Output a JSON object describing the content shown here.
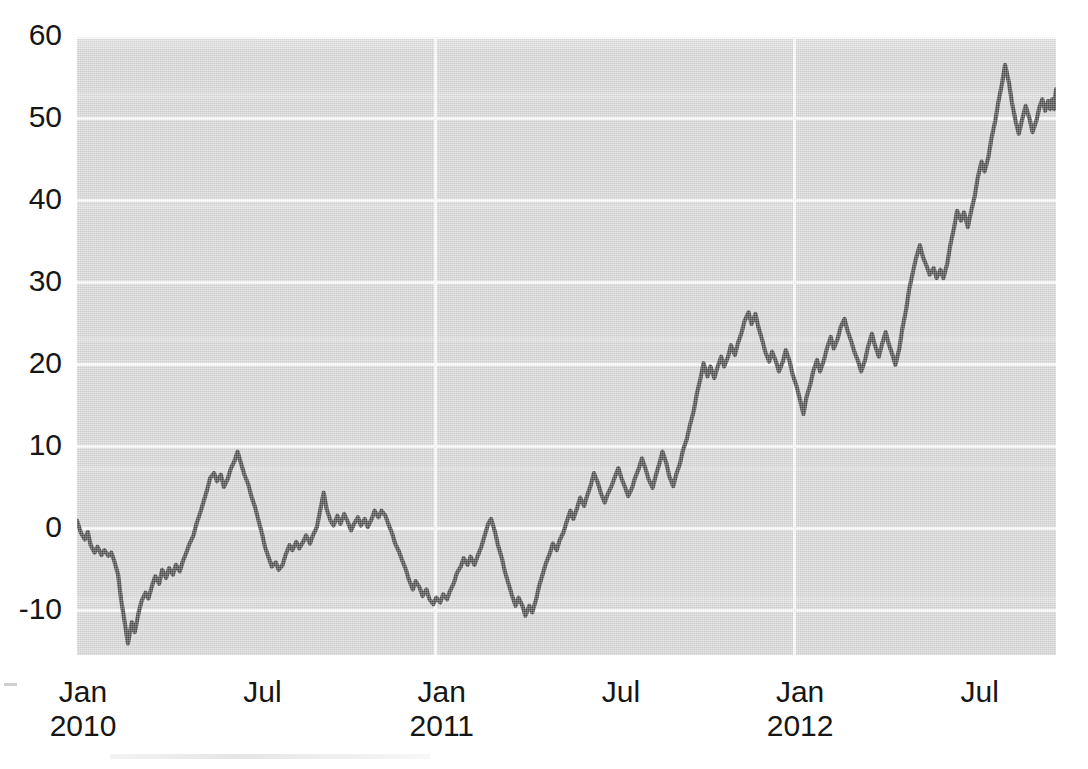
{
  "chart_data": {
    "type": "line",
    "title": "",
    "subtitle": "",
    "xlabel": "",
    "ylabel": "",
    "grid": true,
    "legend": "none",
    "background_color": "#d9d9d9",
    "line_color": "#4d4d4d",
    "gridline_color": "#ffffff",
    "xlim": [
      "2010-01-01",
      "2012-09-20"
    ],
    "ylim": [
      -15.4,
      60
    ],
    "y_ticks": [
      60,
      50,
      40,
      30,
      20,
      10,
      0,
      -10
    ],
    "y_tick_labels": [
      "60",
      "50",
      "40",
      "30",
      "20",
      "10",
      "0",
      "-10"
    ],
    "x_ticks": [
      "2010-01",
      "2010-07",
      "2011-01",
      "2011-07",
      "2012-01",
      "2012-07"
    ],
    "x_tick_labels": [
      {
        "month": "Jan",
        "year": "2010"
      },
      {
        "month": "Jul",
        "year": ""
      },
      {
        "month": "Jan",
        "year": "2011"
      },
      {
        "month": "Jul",
        "year": ""
      },
      {
        "month": "Jan",
        "year": "2012"
      },
      {
        "month": "Jul",
        "year": ""
      }
    ],
    "series": [
      {
        "name": "series-1",
        "color": "#4d4d4d",
        "x": [
          0.0,
          0.006,
          0.012,
          0.018,
          0.024,
          0.03,
          0.036,
          0.042,
          0.048,
          0.054,
          0.06,
          0.066,
          0.072,
          0.078,
          0.084,
          0.09,
          0.096,
          0.102,
          0.108,
          0.114,
          0.12,
          0.126,
          0.132,
          0.138,
          0.144,
          0.15,
          0.156,
          0.162,
          0.168,
          0.174,
          0.18,
          0.186,
          0.192,
          0.198,
          0.204,
          0.21,
          0.216,
          0.222,
          0.228,
          0.234,
          0.24,
          0.246,
          0.252,
          0.258,
          0.264,
          0.27,
          0.276,
          0.282,
          0.288,
          0.294,
          0.3,
          0.306,
          0.312,
          0.318,
          0.324,
          0.33,
          0.336,
          0.342,
          0.348,
          0.354,
          0.36,
          0.366,
          0.372,
          0.378,
          0.384,
          0.39,
          0.396,
          0.402,
          0.408,
          0.414,
          0.42,
          0.426,
          0.432,
          0.438,
          0.444,
          0.45,
          0.456,
          0.462,
          0.468,
          0.474,
          0.48,
          0.486,
          0.492,
          0.498,
          0.504,
          0.51,
          0.516,
          0.522,
          0.528,
          0.534,
          0.54,
          0.546,
          0.552,
          0.558,
          0.564,
          0.57,
          0.576,
          0.582,
          0.588,
          0.594,
          0.6,
          0.606,
          0.612,
          0.618,
          0.624,
          0.63,
          0.636,
          0.642,
          0.648,
          0.654,
          0.66,
          0.666,
          0.672,
          0.678,
          0.684,
          0.69,
          0.696,
          0.702,
          0.708,
          0.714,
          0.72,
          0.726,
          0.732,
          0.738,
          0.744,
          0.75,
          0.756,
          0.762,
          0.768,
          0.774,
          0.78,
          0.786,
          0.792,
          0.798,
          0.804,
          0.81,
          0.816,
          0.822,
          0.828,
          0.834,
          0.84,
          0.846,
          0.852,
          0.858,
          0.864,
          0.87,
          0.876,
          0.882,
          0.888,
          0.894,
          0.9,
          0.906,
          0.912,
          0.918,
          0.924,
          0.93,
          0.936,
          0.942,
          0.948,
          0.954,
          0.96,
          0.966,
          0.972,
          0.978,
          0.984,
          0.99,
          0.996,
          1.0
        ],
        "y": [
          1.0,
          -0.6,
          -1.5,
          -0.8,
          -2.2,
          -3.0,
          -2.4,
          -3.2,
          -2.8,
          -3.4,
          -3.0,
          -4.0,
          -6.0,
          -9.0,
          -12.0,
          -14.0,
          -11.5,
          -12.5,
          -10.5,
          -9.0,
          -8.0,
          -8.6,
          -7.0,
          -6.0,
          -6.8,
          -5.2,
          -6.2,
          -5.0,
          -5.8,
          -4.6,
          -5.4,
          -4.2,
          -3.0,
          -2.0,
          -1.0,
          0.4,
          1.8,
          3.0,
          4.6,
          6.0,
          6.6,
          5.6,
          6.4,
          5.0,
          6.0,
          7.2,
          8.2,
          9.4,
          7.8,
          6.6,
          5.4,
          4.0,
          2.6,
          1.2,
          -0.6,
          -2.2,
          -3.6,
          -4.6,
          -4.2,
          -5.0,
          -4.4,
          -3.2,
          -2.0,
          -2.6,
          -1.6,
          -2.4,
          -1.6,
          -0.8,
          -1.8,
          -0.8,
          0.2,
          2.0,
          4.4,
          2.4,
          1.0,
          0.4,
          1.6,
          0.6,
          1.8,
          1.0,
          -0.2,
          0.6,
          1.4,
          0.4,
          1.2,
          0.2,
          1.2,
          2.2,
          1.4,
          2.2,
          1.6,
          0.6,
          -0.6,
          -1.8,
          -2.8,
          -3.8,
          -5.0,
          -6.2,
          -7.4,
          -6.4,
          -7.2,
          -8.2,
          -7.4,
          -8.6,
          -9.2,
          -8.4,
          -9.0,
          -8.0,
          -8.6,
          -7.6,
          -6.6,
          -5.4,
          -4.6,
          -3.6,
          -4.4,
          -3.4,
          -4.4,
          -3.4,
          -2.2,
          -1.0,
          0.6,
          1.2,
          -0.4,
          -2.0,
          -3.6,
          -5.2,
          -6.8,
          -8.0,
          -9.4,
          -8.4,
          -9.4,
          -10.6,
          -9.4,
          -10.0,
          -8.6,
          -7.0,
          -5.4,
          -4.2,
          -3.0,
          -1.8,
          -2.6,
          -1.4,
          -0.4,
          0.8,
          2.2,
          1.2,
          2.6,
          3.8,
          2.8,
          4.0,
          5.4,
          6.8,
          5.6,
          4.4,
          3.2,
          4.2,
          5.2,
          6.2,
          7.4,
          6.2,
          5.0,
          4.0,
          5.0,
          6.2,
          7.4,
          8.6,
          9.2,
          10.0
        ],
        "notes": "cumulative series, Jan 2010 - Sep 2012"
      }
    ],
    "value_range": {
      "min": -14.0,
      "max": 57.0
    }
  },
  "series_points": [
    [
      0.0,
      1.0
    ],
    [
      0.004,
      -0.5
    ],
    [
      0.008,
      -1.3
    ],
    [
      0.011,
      -0.4
    ],
    [
      0.014,
      -2.0
    ],
    [
      0.018,
      -2.9
    ],
    [
      0.021,
      -2.2
    ],
    [
      0.025,
      -3.2
    ],
    [
      0.028,
      -2.6
    ],
    [
      0.032,
      -3.3
    ],
    [
      0.035,
      -2.9
    ],
    [
      0.038,
      -3.9
    ],
    [
      0.042,
      -5.6
    ],
    [
      0.045,
      -8.6
    ],
    [
      0.049,
      -11.6
    ],
    [
      0.052,
      -14.0
    ],
    [
      0.056,
      -11.4
    ],
    [
      0.059,
      -12.6
    ],
    [
      0.063,
      -10.2
    ],
    [
      0.066,
      -8.8
    ],
    [
      0.07,
      -7.8
    ],
    [
      0.073,
      -8.5
    ],
    [
      0.077,
      -6.8
    ],
    [
      0.08,
      -5.8
    ],
    [
      0.084,
      -6.7
    ],
    [
      0.087,
      -5.0
    ],
    [
      0.091,
      -6.0
    ],
    [
      0.094,
      -4.8
    ],
    [
      0.098,
      -5.6
    ],
    [
      0.101,
      -4.4
    ],
    [
      0.105,
      -5.2
    ],
    [
      0.108,
      -4.0
    ],
    [
      0.112,
      -2.8
    ],
    [
      0.115,
      -1.8
    ],
    [
      0.119,
      -0.8
    ],
    [
      0.122,
      0.6
    ],
    [
      0.126,
      2.0
    ],
    [
      0.129,
      3.2
    ],
    [
      0.133,
      4.8
    ],
    [
      0.136,
      6.2
    ],
    [
      0.14,
      6.8
    ],
    [
      0.143,
      5.8
    ],
    [
      0.147,
      6.6
    ],
    [
      0.15,
      5.1
    ],
    [
      0.154,
      6.1
    ],
    [
      0.157,
      7.3
    ],
    [
      0.161,
      8.3
    ],
    [
      0.164,
      9.4
    ],
    [
      0.168,
      7.8
    ],
    [
      0.171,
      6.6
    ],
    [
      0.175,
      5.4
    ],
    [
      0.178,
      4.0
    ],
    [
      0.182,
      2.6
    ],
    [
      0.185,
      1.2
    ],
    [
      0.189,
      -0.6
    ],
    [
      0.192,
      -2.2
    ],
    [
      0.196,
      -3.6
    ],
    [
      0.199,
      -4.6
    ],
    [
      0.203,
      -4.1
    ],
    [
      0.206,
      -5.0
    ],
    [
      0.21,
      -4.4
    ],
    [
      0.213,
      -3.2
    ],
    [
      0.217,
      -2.0
    ],
    [
      0.22,
      -2.6
    ],
    [
      0.224,
      -1.6
    ],
    [
      0.227,
      -2.4
    ],
    [
      0.231,
      -1.6
    ],
    [
      0.234,
      -0.8
    ],
    [
      0.238,
      -1.8
    ],
    [
      0.241,
      -0.8
    ],
    [
      0.245,
      0.2
    ],
    [
      0.248,
      2.0
    ],
    [
      0.252,
      4.4
    ],
    [
      0.255,
      2.4
    ],
    [
      0.259,
      1.0
    ],
    [
      0.262,
      0.4
    ],
    [
      0.266,
      1.6
    ],
    [
      0.269,
      0.6
    ],
    [
      0.273,
      1.8
    ],
    [
      0.276,
      1.0
    ],
    [
      0.28,
      -0.2
    ],
    [
      0.283,
      0.6
    ],
    [
      0.287,
      1.4
    ],
    [
      0.29,
      0.4
    ],
    [
      0.294,
      1.2
    ],
    [
      0.297,
      0.2
    ],
    [
      0.301,
      1.2
    ],
    [
      0.304,
      2.2
    ],
    [
      0.308,
      1.4
    ],
    [
      0.311,
      2.2
    ],
    [
      0.315,
      1.6
    ],
    [
      0.318,
      0.6
    ],
    [
      0.322,
      -0.6
    ],
    [
      0.325,
      -1.8
    ],
    [
      0.329,
      -2.8
    ],
    [
      0.332,
      -3.8
    ],
    [
      0.336,
      -5.0
    ],
    [
      0.339,
      -6.2
    ],
    [
      0.343,
      -7.4
    ],
    [
      0.346,
      -6.4
    ],
    [
      0.35,
      -7.2
    ],
    [
      0.353,
      -8.2
    ],
    [
      0.357,
      -7.4
    ],
    [
      0.36,
      -8.6
    ],
    [
      0.364,
      -9.2
    ],
    [
      0.367,
      -8.4
    ],
    [
      0.371,
      -9.0
    ],
    [
      0.374,
      -8.0
    ],
    [
      0.378,
      -8.6
    ],
    [
      0.381,
      -7.6
    ],
    [
      0.385,
      -6.6
    ],
    [
      0.388,
      -5.4
    ],
    [
      0.392,
      -4.6
    ],
    [
      0.395,
      -3.6
    ],
    [
      0.399,
      -4.4
    ],
    [
      0.402,
      -3.4
    ],
    [
      0.406,
      -4.4
    ],
    [
      0.409,
      -3.4
    ],
    [
      0.413,
      -2.2
    ],
    [
      0.416,
      -1.0
    ],
    [
      0.42,
      0.6
    ],
    [
      0.423,
      1.2
    ],
    [
      0.427,
      -0.4
    ],
    [
      0.43,
      -2.0
    ],
    [
      0.434,
      -3.6
    ],
    [
      0.437,
      -5.2
    ],
    [
      0.441,
      -6.8
    ],
    [
      0.444,
      -8.0
    ],
    [
      0.448,
      -9.4
    ],
    [
      0.451,
      -8.4
    ],
    [
      0.455,
      -9.4
    ],
    [
      0.458,
      -10.6
    ],
    [
      0.462,
      -9.4
    ],
    [
      0.465,
      -10.2
    ],
    [
      0.469,
      -8.6
    ],
    [
      0.472,
      -7.0
    ],
    [
      0.476,
      -5.4
    ],
    [
      0.479,
      -4.2
    ],
    [
      0.483,
      -3.0
    ],
    [
      0.486,
      -1.8
    ],
    [
      0.49,
      -2.6
    ],
    [
      0.493,
      -1.4
    ],
    [
      0.497,
      -0.4
    ],
    [
      0.5,
      0.8
    ],
    [
      0.504,
      2.2
    ],
    [
      0.507,
      1.2
    ],
    [
      0.511,
      2.6
    ],
    [
      0.514,
      3.8
    ],
    [
      0.518,
      2.8
    ],
    [
      0.521,
      4.0
    ],
    [
      0.525,
      5.4
    ],
    [
      0.528,
      6.8
    ],
    [
      0.532,
      5.6
    ],
    [
      0.535,
      4.4
    ],
    [
      0.539,
      3.2
    ],
    [
      0.542,
      4.2
    ],
    [
      0.546,
      5.2
    ],
    [
      0.549,
      6.2
    ],
    [
      0.553,
      7.4
    ],
    [
      0.556,
      6.2
    ],
    [
      0.56,
      5.0
    ],
    [
      0.563,
      4.0
    ],
    [
      0.567,
      5.0
    ],
    [
      0.57,
      6.2
    ],
    [
      0.574,
      7.4
    ],
    [
      0.577,
      8.6
    ],
    [
      0.581,
      7.2
    ],
    [
      0.584,
      6.0
    ],
    [
      0.588,
      5.0
    ],
    [
      0.591,
      6.4
    ],
    [
      0.595,
      8.0
    ],
    [
      0.598,
      9.4
    ],
    [
      0.602,
      8.0
    ],
    [
      0.605,
      6.4
    ],
    [
      0.609,
      5.2
    ],
    [
      0.612,
      6.6
    ],
    [
      0.616,
      8.0
    ],
    [
      0.619,
      9.6
    ],
    [
      0.623,
      11.0
    ],
    [
      0.626,
      12.6
    ],
    [
      0.63,
      14.4
    ],
    [
      0.633,
      16.4
    ],
    [
      0.637,
      18.4
    ],
    [
      0.64,
      20.2
    ],
    [
      0.644,
      18.6
    ],
    [
      0.647,
      19.8
    ],
    [
      0.651,
      18.4
    ],
    [
      0.654,
      19.6
    ],
    [
      0.658,
      21.0
    ],
    [
      0.661,
      19.8
    ],
    [
      0.665,
      21.0
    ],
    [
      0.668,
      22.4
    ],
    [
      0.672,
      21.2
    ],
    [
      0.675,
      22.6
    ],
    [
      0.679,
      24.0
    ],
    [
      0.682,
      25.4
    ],
    [
      0.686,
      26.4
    ],
    [
      0.689,
      25.0
    ],
    [
      0.693,
      26.2
    ],
    [
      0.696,
      24.6
    ],
    [
      0.7,
      23.0
    ],
    [
      0.703,
      21.6
    ],
    [
      0.707,
      20.4
    ],
    [
      0.71,
      21.6
    ],
    [
      0.714,
      20.4
    ],
    [
      0.717,
      19.2
    ],
    [
      0.721,
      20.4
    ],
    [
      0.724,
      21.8
    ],
    [
      0.728,
      20.4
    ],
    [
      0.731,
      18.8
    ],
    [
      0.735,
      17.4
    ],
    [
      0.738,
      16.0
    ],
    [
      0.742,
      14.0
    ],
    [
      0.745,
      16.0
    ],
    [
      0.749,
      17.6
    ],
    [
      0.752,
      19.2
    ],
    [
      0.756,
      20.6
    ],
    [
      0.759,
      19.2
    ],
    [
      0.763,
      20.6
    ],
    [
      0.766,
      22.0
    ],
    [
      0.77,
      23.4
    ],
    [
      0.773,
      22.0
    ],
    [
      0.777,
      23.2
    ],
    [
      0.78,
      24.6
    ],
    [
      0.784,
      25.6
    ],
    [
      0.787,
      24.2
    ],
    [
      0.791,
      22.8
    ],
    [
      0.794,
      21.6
    ],
    [
      0.798,
      20.4
    ],
    [
      0.801,
      19.2
    ],
    [
      0.805,
      20.6
    ],
    [
      0.808,
      22.2
    ],
    [
      0.812,
      23.8
    ],
    [
      0.815,
      22.4
    ],
    [
      0.819,
      21.0
    ],
    [
      0.822,
      22.4
    ],
    [
      0.826,
      24.0
    ],
    [
      0.829,
      22.6
    ],
    [
      0.833,
      21.2
    ],
    [
      0.836,
      20.0
    ],
    [
      0.84,
      22.0
    ],
    [
      0.843,
      24.4
    ],
    [
      0.847,
      26.8
    ],
    [
      0.85,
      29.2
    ],
    [
      0.854,
      31.4
    ],
    [
      0.857,
      33.0
    ],
    [
      0.861,
      34.6
    ],
    [
      0.864,
      33.2
    ],
    [
      0.868,
      32.0
    ],
    [
      0.871,
      31.0
    ],
    [
      0.875,
      31.8
    ],
    [
      0.878,
      30.6
    ],
    [
      0.882,
      31.6
    ],
    [
      0.885,
      30.6
    ],
    [
      0.889,
      32.4
    ],
    [
      0.892,
      34.6
    ],
    [
      0.896,
      36.8
    ],
    [
      0.899,
      38.8
    ],
    [
      0.903,
      37.6
    ],
    [
      0.906,
      38.6
    ],
    [
      0.91,
      36.8
    ],
    [
      0.913,
      38.6
    ],
    [
      0.917,
      40.6
    ],
    [
      0.92,
      42.8
    ],
    [
      0.924,
      44.8
    ],
    [
      0.927,
      43.6
    ],
    [
      0.931,
      45.4
    ],
    [
      0.934,
      47.6
    ],
    [
      0.938,
      49.8
    ],
    [
      0.941,
      52.0
    ],
    [
      0.945,
      54.4
    ],
    [
      0.948,
      56.6
    ],
    [
      0.952,
      54.4
    ],
    [
      0.955,
      52.0
    ],
    [
      0.959,
      49.6
    ],
    [
      0.962,
      48.2
    ],
    [
      0.966,
      50.2
    ],
    [
      0.969,
      51.6
    ],
    [
      0.973,
      50.0
    ],
    [
      0.976,
      48.4
    ],
    [
      0.98,
      49.8
    ],
    [
      0.983,
      51.4
    ],
    [
      0.986,
      52.4
    ],
    [
      0.989,
      51.0
    ],
    [
      0.992,
      52.2
    ],
    [
      0.994,
      51.2
    ],
    [
      0.996,
      52.4
    ],
    [
      0.998,
      51.2
    ],
    [
      0.999,
      52.6
    ],
    [
      1.0,
      53.6
    ]
  ],
  "axes": {
    "y_labels": [
      "60",
      "50",
      "40",
      "30",
      "20",
      "10",
      "0",
      "-10"
    ],
    "x_labels": [
      {
        "month": "Jan",
        "year": "2010"
      },
      {
        "month": "Jul",
        "year": ""
      },
      {
        "month": "Jan",
        "year": "2011"
      },
      {
        "month": "Jul",
        "year": ""
      },
      {
        "month": "Jan",
        "year": "2012"
      },
      {
        "month": "Jul",
        "year": ""
      }
    ]
  }
}
